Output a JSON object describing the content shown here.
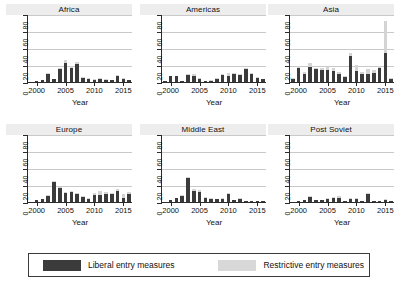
{
  "figure": {
    "axis_title_x": "Year",
    "y_ticks": [
      "0",
      "20",
      "40",
      "60",
      "80"
    ],
    "x_ticks": [
      "2000",
      "2005",
      "2010",
      "2015"
    ]
  },
  "legend": {
    "liberal_label": "Liberal entry measures",
    "restrictive_label": "Restrictive entry measures",
    "liberal_color": "#3b3b3b",
    "restrictive_color": "#d8d8d8"
  },
  "panels": [
    {
      "title": "Africa"
    },
    {
      "title": "Americas"
    },
    {
      "title": "Asia"
    },
    {
      "title": "Europe"
    },
    {
      "title": "Middle East"
    },
    {
      "title": "Post Soviet"
    }
  ],
  "chart_data": {
    "type": "bar",
    "title": "",
    "subtitle": "",
    "stacked": true,
    "grid": true,
    "legend_position": "bottom",
    "xlabel": "Year",
    "ylabel": "",
    "ylim": [
      0,
      80
    ],
    "yticks": [
      0,
      20,
      40,
      60,
      80
    ],
    "xticks": [
      2000,
      2005,
      2010,
      2015
    ],
    "x": [
      1999,
      2000,
      2001,
      2002,
      2003,
      2004,
      2005,
      2006,
      2007,
      2008,
      2009,
      2010,
      2011,
      2012,
      2013,
      2014,
      2015,
      2016
    ],
    "series_names": [
      "Liberal entry measures",
      "Restrictive entry measures"
    ],
    "panels": [
      {
        "name": "Africa",
        "series": [
          {
            "name": "Liberal entry measures",
            "values": [
              0,
              1,
              2,
              10,
              3,
              15,
              22,
              17,
              21,
              5,
              3,
              2,
              3,
              2,
              2,
              7,
              4,
              2
            ]
          },
          {
            "name": "Restrictive entry measures",
            "values": [
              0,
              0,
              0,
              1,
              0,
              1,
              4,
              2,
              3,
              1,
              1,
              1,
              2,
              1,
              0,
              1,
              1,
              0
            ]
          }
        ]
      },
      {
        "name": "Americas",
        "series": [
          {
            "name": "Liberal entry measures",
            "values": [
              1,
              7,
              7,
              1,
              8,
              7,
              3,
              1,
              1,
              3,
              8,
              7,
              9,
              8,
              15,
              9,
              5,
              4
            ]
          },
          {
            "name": "Restrictive entry measures",
            "values": [
              0,
              0,
              0,
              0,
              1,
              2,
              1,
              0,
              1,
              1,
              2,
              4,
              2,
              2,
              1,
              1,
              1,
              0
            ]
          }
        ]
      },
      {
        "name": "Asia",
        "series": [
          {
            "name": "Liberal entry measures",
            "values": [
              3,
              17,
              10,
              18,
              15,
              14,
              14,
              13,
              10,
              6,
              31,
              13,
              10,
              9,
              11,
              17,
              34,
              3
            ]
          },
          {
            "name": "Restrictive entry measures",
            "values": [
              1,
              2,
              2,
              4,
              2,
              2,
              4,
              4,
              2,
              1,
              3,
              7,
              2,
              6,
              3,
              2,
              38,
              1
            ]
          }
        ]
      },
      {
        "name": "Europe",
        "series": [
          {
            "name": "Liberal entry measures",
            "values": [
              0,
              2,
              4,
              7,
              24,
              16,
              11,
              12,
              10,
              6,
              4,
              8,
              8,
              9,
              9,
              13,
              5,
              10
            ]
          },
          {
            "name": "Restrictive entry measures",
            "values": [
              0,
              0,
              0,
              1,
              1,
              1,
              1,
              1,
              1,
              1,
              1,
              3,
              5,
              3,
              2,
              2,
              4,
              2
            ]
          }
        ]
      },
      {
        "name": "Middle East",
        "series": [
          {
            "name": "Liberal entry measures",
            "values": [
              0,
              2,
              5,
              7,
              28,
              13,
              12,
              5,
              4,
              3,
              4,
              9,
              2,
              3,
              1,
              1,
              1,
              1
            ]
          },
          {
            "name": "Restrictive entry measures",
            "values": [
              0,
              0,
              0,
              1,
              1,
              2,
              2,
              1,
              1,
              0,
              1,
              1,
              0,
              1,
              0,
              0,
              0,
              0
            ]
          }
        ]
      },
      {
        "name": "Post Soviet",
        "series": [
          {
            "name": "Liberal entry measures",
            "values": [
              0,
              1,
              2,
              6,
              2,
              2,
              4,
              5,
              5,
              1,
              3,
              3,
              1,
              9,
              1,
              1,
              2,
              1
            ]
          },
          {
            "name": "Restrictive entry measures",
            "values": [
              0,
              0,
              0,
              1,
              0,
              0,
              1,
              1,
              2,
              0,
              1,
              1,
              0,
              1,
              0,
              0,
              1,
              0
            ]
          }
        ]
      }
    ]
  }
}
